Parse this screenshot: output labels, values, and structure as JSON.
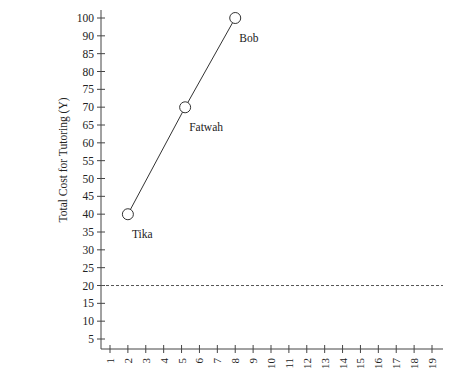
{
  "chart_data": {
    "type": "line",
    "title": "",
    "xlabel": "",
    "ylabel": "Total Cost for Tutoring (Y)",
    "x_ticks": [
      "1",
      "2",
      "3",
      "4",
      "5",
      "6",
      "7",
      "8",
      "9",
      "10",
      "11",
      "12",
      "13",
      "14",
      "15",
      "16",
      "17",
      "18",
      "19"
    ],
    "y_ticks": [
      "100",
      "90",
      "85",
      "80",
      "75",
      "70",
      "65",
      "60",
      "55",
      "50",
      "45",
      "40",
      "35",
      "30",
      "25",
      "20",
      "15",
      "10",
      "5"
    ],
    "xlim": [
      0.5,
      19.5
    ],
    "ylim": [
      0,
      102
    ],
    "grid": false,
    "legend": "none",
    "series": [
      {
        "name": "Tutoring cost",
        "points": [
          {
            "label": "Tika",
            "x": 2,
            "y": 40
          },
          {
            "label": "Fatwah",
            "x": 5.2,
            "y": 70
          },
          {
            "label": "Bob",
            "x": 8,
            "y": 100
          }
        ],
        "marker": "open-circle",
        "line": "solid"
      }
    ],
    "reference_lines": [
      {
        "type": "horizontal",
        "y": 20,
        "style": "dashed"
      }
    ]
  }
}
